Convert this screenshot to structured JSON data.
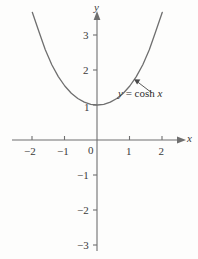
{
  "figure": {
    "background_color": "#fdfdfc",
    "ink_color": "#6f6f6f",
    "text_color": "#3a3a3a"
  },
  "axes": {
    "x_axis_name": "x",
    "y_axis_name": "y",
    "origin_label": "0",
    "x_tick_labels": [
      "−2",
      "−1",
      "1",
      "2"
    ],
    "y_tick_labels": [
      "3",
      "2",
      "1",
      "−1",
      "−2",
      "−3"
    ]
  },
  "annotation": {
    "lhs": "y",
    "equals": "=",
    "func": "cosh",
    "arg": "x",
    "full_text": "y = cosh x"
  },
  "chart_data": {
    "type": "line",
    "title": "",
    "subtitle": "",
    "xlabel": "x",
    "ylabel": "y",
    "grid": false,
    "legend_position": "inline-annotation",
    "annotations": [
      {
        "text": "y = cosh x",
        "x": 1.7,
        "y": 1.45,
        "points_to_x": 1.18,
        "points_to_y": 1.78
      }
    ],
    "xlim": [
      -2.6,
      2.7
    ],
    "ylim": [
      -3.4,
      3.8
    ],
    "xticks": [
      -2,
      -1,
      0,
      1,
      2
    ],
    "yticks": [
      -3,
      -2,
      -1,
      1,
      2,
      3
    ],
    "series": [
      {
        "name": "y = cosh x",
        "function": "cosh(x)",
        "x": [
          -2.0,
          -1.8,
          -1.6,
          -1.4,
          -1.2,
          -1.0,
          -0.8,
          -0.6,
          -0.4,
          -0.2,
          0.0,
          0.2,
          0.4,
          0.6,
          0.8,
          1.0,
          1.2,
          1.4,
          1.6,
          1.8,
          2.0
        ],
        "y": [
          3.762,
          3.107,
          2.577,
          2.151,
          1.811,
          1.543,
          1.337,
          1.185,
          1.081,
          1.02,
          1.0,
          1.02,
          1.081,
          1.185,
          1.337,
          1.543,
          1.811,
          2.151,
          2.577,
          3.107,
          3.762
        ]
      }
    ]
  }
}
